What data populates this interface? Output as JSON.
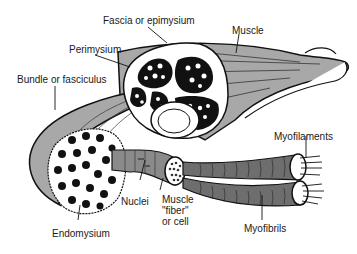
{
  "diagram": {
    "labels": {
      "fascia": "Fascia or epimysium",
      "muscle": "Muscle",
      "perimysium": "Perimysium",
      "bundle": "Bundle or fasciculus",
      "myofilaments": "Myofilaments",
      "nuclei": "Nuclei",
      "fiber_line1": "Muscle",
      "fiber_line2": "\"fiber\"",
      "fiber_line3": "or cell",
      "endomysium": "Endomysium",
      "myofibrils": "Myofibrils"
    },
    "colors": {
      "muscle_fill": "#a8a8a8",
      "fiber_fill": "#6e6e6e",
      "outline": "#111111",
      "background": "#ffffff"
    }
  }
}
